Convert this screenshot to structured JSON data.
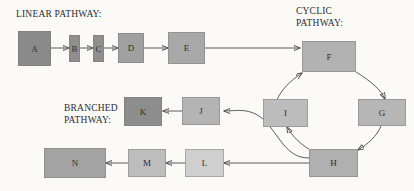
{
  "figure": {
    "background_color": "#fbfaf7",
    "line_color": "#4a4a4a",
    "label_color": "#2b2b2b"
  },
  "headings": {
    "linear": "LINEAR PATHWAY:",
    "cyclic_line1": "CYCLIC",
    "cyclic_line2": "PATHWAY:",
    "branched_line1": "BRANCHED",
    "branched_line2": "PATHWAY:"
  },
  "nodes": {
    "a": {
      "label": "A",
      "color": "#8a8a8a"
    },
    "b": {
      "label": "B",
      "color": "#8f8f8f"
    },
    "c": {
      "label": "C",
      "color": "#8f8f8f"
    },
    "d": {
      "label": "D",
      "color": "#a0a0a0"
    },
    "e": {
      "label": "E",
      "color": "#a8a8a8"
    },
    "f": {
      "label": "F",
      "color": "#b2b2b2"
    },
    "g": {
      "label": "G",
      "color": "#b6b6b6"
    },
    "h": {
      "label": "H",
      "color": "#b0b0b0"
    },
    "i": {
      "label": "I",
      "color": "#bcbcbc"
    },
    "j": {
      "label": "J",
      "color": "#b4b4b4"
    },
    "k": {
      "label": "K",
      "color": "#8d8d8d"
    },
    "l": {
      "label": "L",
      "color": "#cfcfcf"
    },
    "m": {
      "label": "M",
      "color": "#bdbdbd"
    },
    "n": {
      "label": "N",
      "color": "#a3a3a3"
    }
  },
  "edges": [
    {
      "from": "A",
      "to": "B",
      "style": "straight"
    },
    {
      "from": "B",
      "to": "C",
      "style": "straight"
    },
    {
      "from": "C",
      "to": "D",
      "style": "straight"
    },
    {
      "from": "D",
      "to": "E",
      "style": "straight"
    },
    {
      "from": "E",
      "to": "F",
      "style": "straight"
    },
    {
      "from": "F",
      "to": "G",
      "style": "curved"
    },
    {
      "from": "G",
      "to": "H",
      "style": "curved"
    },
    {
      "from": "H",
      "to": "I",
      "style": "curved"
    },
    {
      "from": "I",
      "to": "F",
      "style": "curved"
    },
    {
      "from": "H",
      "to": "J",
      "style": "curved"
    },
    {
      "from": "J",
      "to": "K",
      "style": "straight"
    },
    {
      "from": "H",
      "to": "L",
      "style": "straight"
    },
    {
      "from": "L",
      "to": "M",
      "style": "straight"
    },
    {
      "from": "M",
      "to": "N",
      "style": "straight"
    }
  ]
}
